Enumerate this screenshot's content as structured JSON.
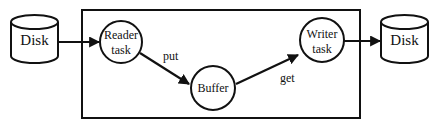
{
  "diagram": {
    "source_disk": {
      "label": "Disk",
      "icon": "disk-cylinder-icon"
    },
    "reader_task": {
      "line1": "Reader",
      "line2": "task"
    },
    "buffer": {
      "label": "Buffer"
    },
    "writer_task": {
      "line1": "Writer",
      "line2": "task"
    },
    "target_disk": {
      "label": "Disk",
      "icon": "disk-cylinder-icon"
    },
    "edges": {
      "put": "put",
      "get": "get"
    },
    "colors": {
      "stroke": "#111111",
      "background": "#ffffff"
    }
  }
}
